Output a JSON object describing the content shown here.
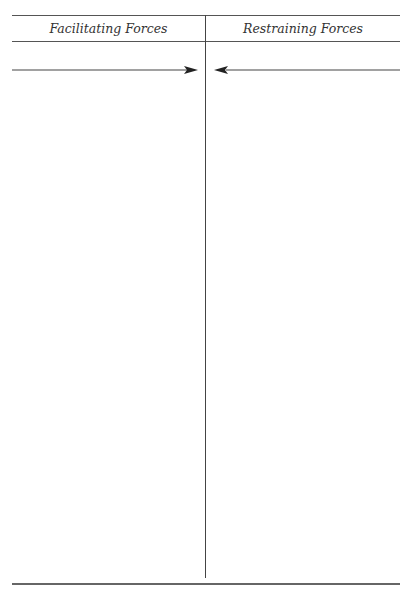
{
  "diagram": {
    "type": "force-field-analysis",
    "columns": [
      {
        "label": "Facilitating Forces"
      },
      {
        "label": "Restraining Forces"
      }
    ],
    "arrows": [
      {
        "direction": "right",
        "column": "Facilitating Forces"
      },
      {
        "direction": "left",
        "column": "Restraining Forces"
      }
    ],
    "colors": {
      "line": "#444444",
      "text": "#333333",
      "background": "#ffffff"
    }
  }
}
